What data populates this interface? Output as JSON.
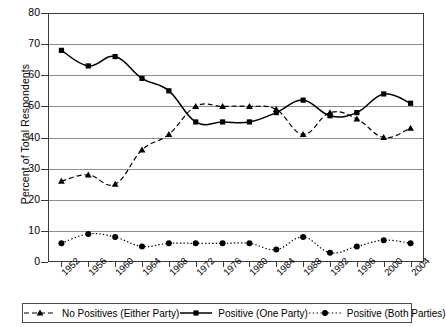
{
  "chart_data": {
    "type": "line",
    "title": "",
    "xlabel": "",
    "ylabel": "Percent of Total Respondents",
    "categories": [
      "1952",
      "1956",
      "1960",
      "1964",
      "1968",
      "1972",
      "1976",
      "1980",
      "1984",
      "1988",
      "1992",
      "1996",
      "2000",
      "2004"
    ],
    "ylim": [
      0,
      80
    ],
    "yticks": [
      0,
      10,
      20,
      30,
      40,
      50,
      60,
      70,
      80
    ],
    "grid": true,
    "legend_position": "bottom",
    "series": [
      {
        "name": "No Positives (Either Party)",
        "marker": "triangle",
        "linestyle": "dashed",
        "color": "#000000",
        "values": [
          26,
          28,
          25,
          36,
          41,
          50,
          50,
          50,
          49,
          41,
          48,
          46,
          40,
          43
        ]
      },
      {
        "name": "Positive (One Party)",
        "marker": "square",
        "linestyle": "solid",
        "color": "#000000",
        "values": [
          68,
          63,
          66,
          59,
          55,
          45,
          45,
          45,
          48,
          52,
          47,
          48,
          54,
          51
        ]
      },
      {
        "name": "Positive (Both Parties)",
        "marker": "circle",
        "linestyle": "dotted",
        "color": "#000000",
        "values": [
          6,
          9,
          8,
          5,
          6,
          6,
          6,
          6,
          4,
          8,
          3,
          5,
          7,
          6
        ]
      }
    ]
  },
  "axis": {
    "y_title": "Percent of Total Respondents",
    "y_tick_labels": [
      "80",
      "70",
      "60",
      "50",
      "40",
      "30",
      "20",
      "10",
      "0"
    ],
    "x_tick_labels": [
      "1952",
      "1956",
      "1960",
      "1964",
      "1968",
      "1972",
      "1976",
      "1980",
      "1984",
      "1988",
      "1992",
      "1996",
      "2000",
      "2004"
    ]
  },
  "legend": {
    "items": [
      {
        "label": "No Positives (Either Party)",
        "marker": "triangle-marker",
        "style": "dashed"
      },
      {
        "label": "Positive (One Party)",
        "marker": "square-marker",
        "style": "solid"
      },
      {
        "label": "Positive (Both Parties)",
        "marker": "circle-marker",
        "style": "dotted"
      }
    ]
  },
  "colors": {
    "line": "#000000",
    "grid": "#8e8e8e",
    "frame": "#3a3a3a",
    "background": "#ffffff"
  }
}
